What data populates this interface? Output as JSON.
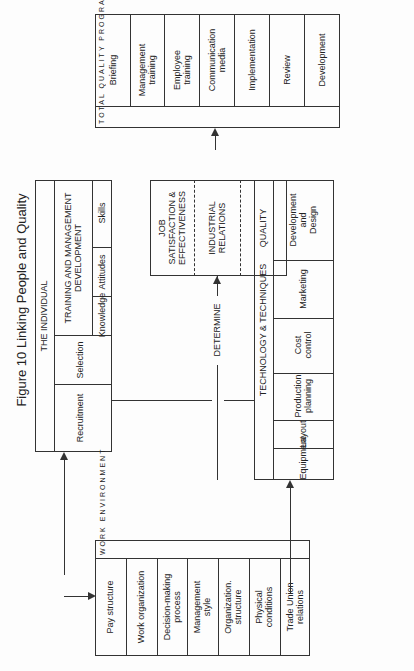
{
  "title": "Figure 10  Linking People and Quality",
  "programme": {
    "label": "TOTAL QUALITY PROGRAMME",
    "stack_1": "T\nO\nT\nA\nL\n\nQ\nU\nA\nL\nI\nT\nY\n\nP\nR\nO\nG\nR\nA\nM\nM\nE",
    "items": [
      "Briefing",
      "Management\ntraining",
      "Employee\ntraining",
      "Communication\nmedia",
      "Implementation",
      "Review",
      "Development"
    ]
  },
  "individual": {
    "label": "THE INDIVIDUAL",
    "recruitment": "Recruitment",
    "selection": "Selection",
    "training": "TRAINING AND MANAGEMENT\nDEVELOPMENT",
    "knowledge": "Knowledge",
    "attitudes": "Attitudes",
    "skills": "Skills"
  },
  "outcomes": {
    "job": "JOB\nSATISFACTION &\nEFFECTIVENESS",
    "ir": "INDUSTRIAL\nRELATIONS",
    "quality": "QUALITY"
  },
  "determine": "DETERMINE",
  "technology": {
    "label": "TECHNOLOGY & TECHNIQUES",
    "items": [
      "Equipment",
      "Layout",
      "Production\nplanning",
      "Cost\ncontrol",
      "Marketing",
      "Development\nand\nDesign"
    ]
  },
  "work": {
    "label": "WORK ENVIRONMENT",
    "stack": "W\nO\nR\nK\n\nE\nN\nV\nI\nR\nO\nN\nM\nE\nN\nT",
    "items": [
      "Pay structure",
      "Work organization",
      "Decision-making\nprocess",
      "Management\nstyle",
      "Organization.\nstructure",
      "Physical\nconditions",
      "Trade Union\nrelations",
      "Communications"
    ]
  }
}
